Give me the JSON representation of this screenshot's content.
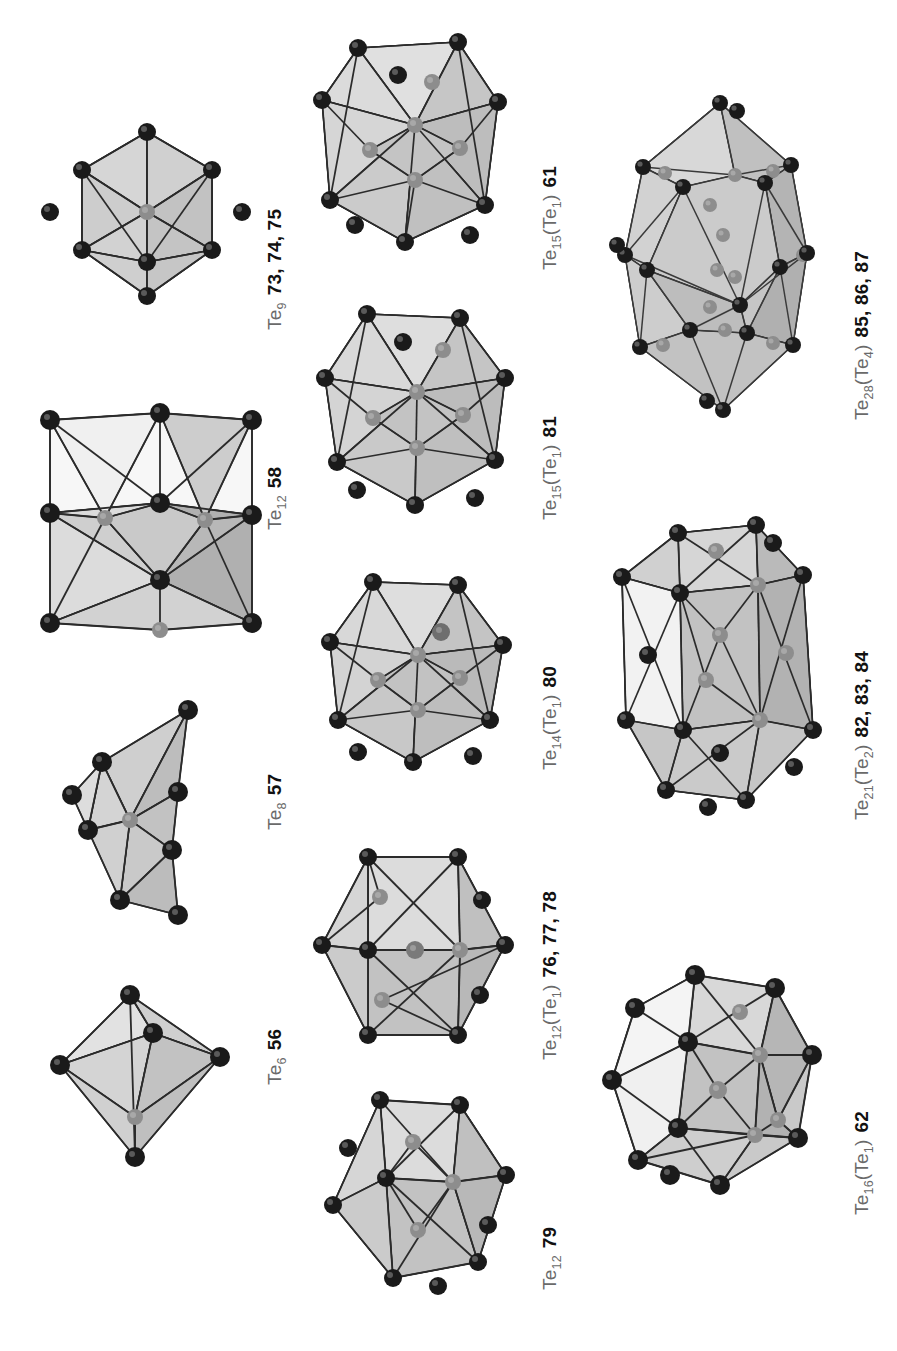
{
  "figure": {
    "kind": "polyhedral-cluster-plate",
    "background": "#ffffff",
    "columns": 3,
    "palette": {
      "vertex_front": "#1a1a1a",
      "vertex_back": "#8d8d8d",
      "edge": "#2b2b2b",
      "face_light": "#e2e2e2",
      "face_mid": "#c9c9c9",
      "face_dark": "#b0b0b0",
      "face_white": "#f7f7f7",
      "label_formula": "#6a6a6a",
      "label_number": "#111111"
    }
  },
  "clusters": [
    {
      "id": "te9",
      "formula_html": "Te<sub>9</sub>",
      "numbers": "73, 74, 75",
      "shape": "tricapped-trigonal-prism",
      "vertex_count": 9
    },
    {
      "id": "te12-58",
      "formula_html": "Te<sub>12</sub>",
      "numbers": "58",
      "shape": "cuboctahedron-like",
      "vertex_count": 12
    },
    {
      "id": "te8",
      "formula_html": "Te<sub>8</sub>",
      "numbers": "57",
      "shape": "bisdisphenoid",
      "vertex_count": 8
    },
    {
      "id": "te6",
      "formula_html": "Te<sub>6</sub>",
      "numbers": "56",
      "shape": "octahedron",
      "vertex_count": 6
    },
    {
      "id": "te15-61",
      "formula_html": "Te<sub>15</sub>(Te<sub>1</sub>)",
      "numbers": "61",
      "shape": "centred-polyhedron",
      "vertex_count": 15
    },
    {
      "id": "te15-81",
      "formula_html": "Te<sub>15</sub>(Te<sub>1</sub>)",
      "numbers": "81",
      "shape": "centred-polyhedron",
      "vertex_count": 15
    },
    {
      "id": "te14-80",
      "formula_html": "Te<sub>14</sub>(Te<sub>1</sub>)",
      "numbers": "80",
      "shape": "centred-polyhedron",
      "vertex_count": 14
    },
    {
      "id": "te12-767778",
      "formula_html": "Te<sub>12</sub>(Te<sub>1</sub>)",
      "numbers": "76, 77, 78",
      "shape": "centred-icosahedron",
      "vertex_count": 12
    },
    {
      "id": "te12-79",
      "formula_html": "Te<sub>12</sub>",
      "numbers": "79",
      "shape": "icosahedron",
      "vertex_count": 12
    },
    {
      "id": "te28",
      "formula_html": "Te<sub>28</sub>(Te<sub>4</sub>)",
      "numbers": "85, 86, 87",
      "shape": "large-elongated-cage",
      "vertex_count": 28
    },
    {
      "id": "te21",
      "formula_html": "Te<sub>21</sub>(Te<sub>2</sub>)",
      "numbers": "82, 83, 84",
      "shape": "elongated-cage",
      "vertex_count": 21
    },
    {
      "id": "te16",
      "formula_html": "Te<sub>16</sub>(Te<sub>1</sub>)",
      "numbers": "62",
      "shape": "centred-cage",
      "vertex_count": 16
    }
  ]
}
